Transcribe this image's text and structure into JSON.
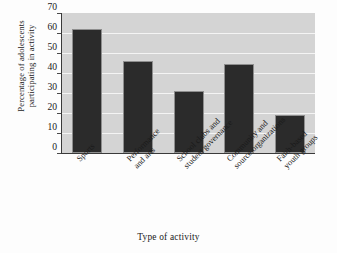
{
  "chart_data": {
    "type": "bar",
    "title": "",
    "subtitle": "",
    "categories": [
      "Sports",
      "Performance and arts",
      "School clubs and student governance",
      "Community and source organizations",
      "Faith-based youth groups"
    ],
    "category_lines": [
      [
        "Sports",
        ""
      ],
      [
        "Performance",
        "and arts"
      ],
      [
        "School clubs and",
        "student governance"
      ],
      [
        "Community and",
        "source organizations"
      ],
      [
        "Faith-based",
        "youth groups"
      ]
    ],
    "values": [
      62,
      46,
      31,
      44.5,
      19
    ],
    "xlabel": "Type of activity",
    "ylabel_lines": [
      "Percentage of adolescents",
      "participating in activity"
    ],
    "ylabel": "Percentage of adolescents participating in activity",
    "ylim": [
      0,
      70
    ],
    "ytick_labels": [
      "0",
      "10",
      "20",
      "30",
      "40",
      "50",
      "60",
      "70"
    ],
    "ytick_values": [
      0,
      10,
      20,
      30,
      40,
      50,
      60,
      70
    ],
    "grid": true,
    "grid_orientation": "horizontal",
    "legend": null,
    "legend_position": "none",
    "colors": {
      "bar": "#2b2b2b",
      "plot_background": "#d4d4d4",
      "gridline": "#f4f4f4",
      "axis": "#3a3a3a",
      "text": "#1a1a1a",
      "figure_background": "#fdfdfd"
    }
  }
}
